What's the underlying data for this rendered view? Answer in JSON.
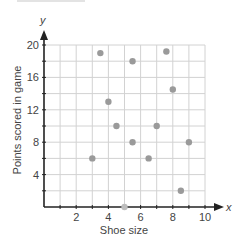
{
  "chart_data": {
    "type": "scatter",
    "title": "",
    "xlabel": "Shoe size",
    "ylabel": "Points scored in game",
    "x_axis_letter": "x",
    "y_axis_letter": "y",
    "xlim": [
      0,
      10
    ],
    "ylim": [
      0,
      20
    ],
    "x_ticks": [
      2,
      4,
      6,
      8,
      10
    ],
    "y_ticks": [
      4,
      8,
      12,
      16,
      20
    ],
    "x_grid_step": 1,
    "y_grid_step": 2,
    "grid": true,
    "legend": null,
    "points_color": "#9a9a9a",
    "series": [
      {
        "name": "data",
        "points": [
          {
            "x": 3,
            "y": 6
          },
          {
            "x": 3.5,
            "y": 19
          },
          {
            "x": 4,
            "y": 13
          },
          {
            "x": 4.5,
            "y": 10
          },
          {
            "x": 5,
            "y": 0
          },
          {
            "x": 5.5,
            "y": 18
          },
          {
            "x": 5.5,
            "y": 8
          },
          {
            "x": 6.5,
            "y": 6
          },
          {
            "x": 7,
            "y": 10
          },
          {
            "x": 7.6,
            "y": 19.2
          },
          {
            "x": 8,
            "y": 14.5
          },
          {
            "x": 8.5,
            "y": 2
          },
          {
            "x": 9,
            "y": 8
          }
        ]
      }
    ]
  }
}
